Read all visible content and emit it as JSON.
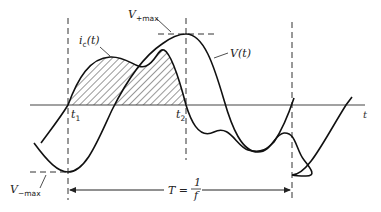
{
  "diagram": {
    "type": "waveform-timing",
    "axis": {
      "label": "t"
    },
    "curves": [
      {
        "id": "voltage",
        "label": "V(t)",
        "label_main": "V",
        "label_arg": "(t)"
      },
      {
        "id": "current",
        "label": "i_c(t)",
        "label_main": "i",
        "label_sub": "c",
        "label_arg": "(t)"
      }
    ],
    "markers": {
      "t1": {
        "main": "t",
        "sub": "1"
      },
      "t2": {
        "main": "t",
        "sub": "2"
      }
    },
    "levels": {
      "vmax_pos": {
        "main": "V",
        "sub": "+max"
      },
      "vmax_neg": {
        "main": "V",
        "sub": "−max"
      }
    },
    "period": {
      "lhs": "T =",
      "num": "1",
      "den": "f"
    },
    "shaded_region": "area under i_c(t) between t1 and t2"
  }
}
